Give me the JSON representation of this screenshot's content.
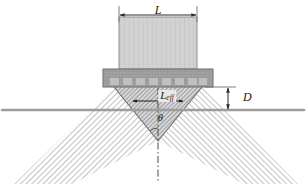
{
  "figure": {
    "background_color": "#ffffff"
  },
  "labels": {
    "aperture_length": "L",
    "standoff_depth": "D",
    "effective_length_base": "L",
    "effective_length_subscript": "eff",
    "beam_angle": "θ"
  },
  "components": {
    "backing_block": {
      "name": "backing-block",
      "fill": "#cfcfcf",
      "stroke": "#8a8a8a",
      "stripe_color": "#c2c2c2",
      "x": 119,
      "y": 17,
      "width": 78,
      "height": 52,
      "stripe_count": 17
    },
    "array_plate": {
      "name": "array-plate",
      "fill": "#9a9a9a",
      "stroke": "#6e6e6e",
      "x": 103,
      "y": 69,
      "width": 110,
      "height": 18,
      "element_fill": "#bdbdbd",
      "element_count": 8
    },
    "surface_line": {
      "name": "surface-line",
      "color": "#9d9d9d",
      "y": 110,
      "x1": 2,
      "x2": 304,
      "thickness": 2.4
    },
    "center_axis": {
      "name": "center-axis",
      "color": "#4a4a4a",
      "x": 158,
      "y1": 88,
      "y2": 180,
      "dash": "dashdot"
    }
  },
  "beams": {
    "outer_left": {
      "name": "beam-outer-left",
      "hatch_color": "#c9c9c9",
      "direction": "forward-slash"
    },
    "outer_right": {
      "name": "beam-outer-right",
      "hatch_color": "#c9c9c9",
      "direction": "back-slash"
    },
    "focus_triangle": {
      "name": "beam-focus-triangle",
      "hatch_color": "#9d9d9d",
      "apex_x": 158,
      "apex_y": 141,
      "left_x": 114,
      "right_x": 202,
      "top_y": 87
    }
  },
  "dimensions": {
    "L": {
      "name": "dimension-L",
      "x1": 119,
      "x2": 197,
      "y": 15,
      "ext_top": 5,
      "ext_bottom": 20,
      "color": "#2b2b2b"
    },
    "D": {
      "name": "dimension-D",
      "x": 228,
      "y1": 87,
      "y2": 110,
      "color": "#2b2b2b"
    },
    "Leff": {
      "name": "dimension-Leff",
      "x1": 132,
      "x2": 184,
      "y": 101,
      "color": "#1f1f1f"
    }
  }
}
